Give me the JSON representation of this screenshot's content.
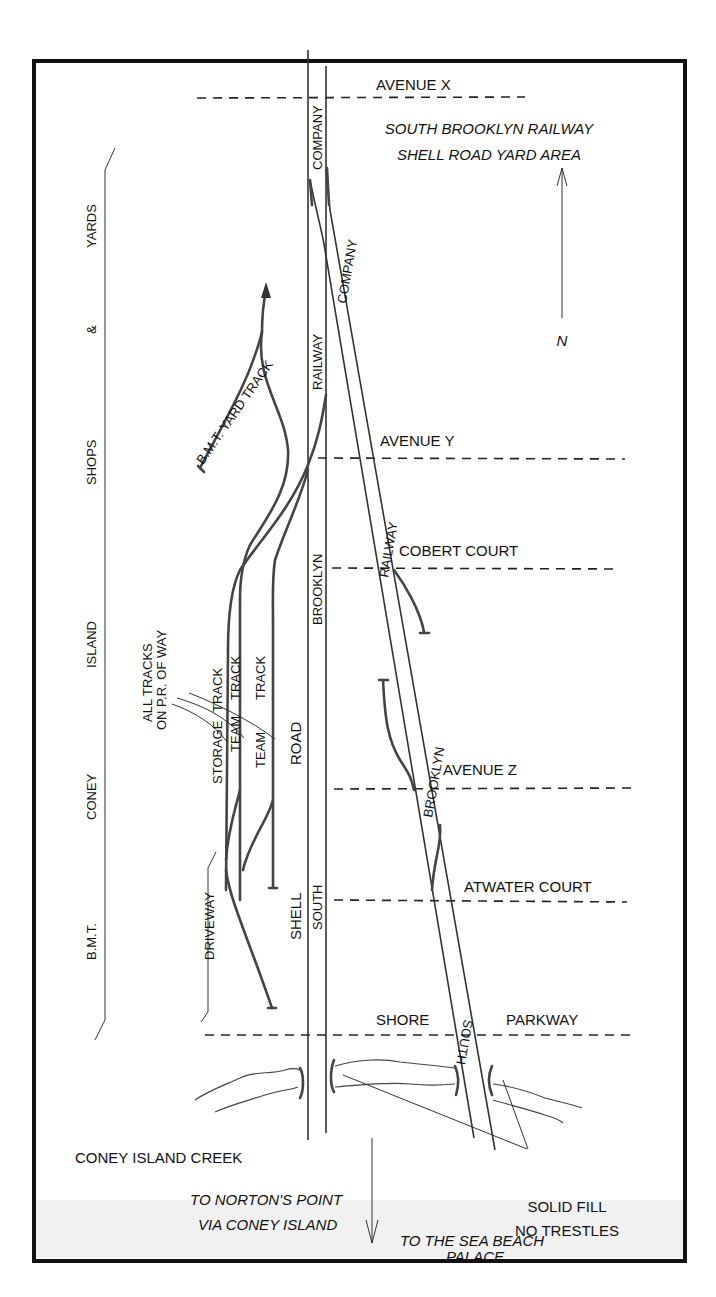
{
  "title": {
    "line1": "SOUTH BROOKLYN RAILWAY",
    "line2": "SHELL ROAD YARD AREA"
  },
  "north_arrow": {
    "label": "N"
  },
  "streets": [
    {
      "name": "AVENUE X"
    },
    {
      "name": "AVENUE Y"
    },
    {
      "name": "COBERT COURT"
    },
    {
      "name": "AVENUE Z"
    },
    {
      "name": "ATWATER COURT"
    },
    {
      "name": "SHORE"
    },
    {
      "name": "PARKWAY"
    }
  ],
  "main_line_labels": {
    "vertical": [
      "COMPANY",
      "RAILWAY",
      "BROOKLYN",
      "SOUTH"
    ],
    "diagonal": [
      "COMPANY",
      "RAILWAY",
      "BROOKLYN",
      "SOUTH"
    ]
  },
  "road_labels": [
    "SHELL",
    "ROAD"
  ],
  "side_label": [
    "B.M.T.",
    "CONEY",
    "ISLAND",
    "SHOPS",
    "&",
    "YARDS"
  ],
  "yard": {
    "bmt_yard_track": "B.M.T. YARD TRACK",
    "note_line1": "ALL TRACKS",
    "note_line2": "ON P.R. OF WAY",
    "tracks": [
      {
        "label1": "STORAGE",
        "label2": "TRACK"
      },
      {
        "label1": "TEAM",
        "label2": "TRACK"
      },
      {
        "label1": "TEAM",
        "label2": "TRACK"
      }
    ],
    "driveway": "DRIVEWAY"
  },
  "bottom": {
    "creek": "CONEY ISLAND CREEK",
    "norton_line1": "TO NORTON'S POINT",
    "norton_line2": "VIA CONEY ISLAND",
    "fill_line1": "SOLID FILL",
    "fill_line2": "NO TRESTLES",
    "sea_beach_line1": "TO THE SEA BEACH",
    "sea_beach_line2": "PALACE"
  }
}
